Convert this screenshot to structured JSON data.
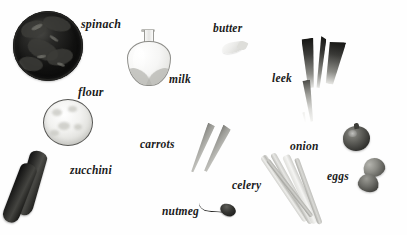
{
  "diagram": {
    "kind": "ingredient-photo-diagram",
    "background_color": "#ffffff",
    "label_color": "#1a1a1a",
    "label_style": "italic serif",
    "labels": [
      {
        "id": "spinach",
        "text": "spinach",
        "x": 81,
        "y": 18
      },
      {
        "id": "butter",
        "text": "butter",
        "x": 213,
        "y": 23
      },
      {
        "id": "milk",
        "text": "milk",
        "x": 169,
        "y": 74
      },
      {
        "id": "leek",
        "text": "leek",
        "x": 272,
        "y": 73
      },
      {
        "id": "flour",
        "text": "flour",
        "x": 78,
        "y": 86
      },
      {
        "id": "carrots",
        "text": "carrots",
        "x": 140,
        "y": 139
      },
      {
        "id": "onion",
        "text": "onion",
        "x": 290,
        "y": 141
      },
      {
        "id": "zucchini",
        "text": "zucchini",
        "x": 70,
        "y": 165
      },
      {
        "id": "eggs",
        "text": "eggs",
        "x": 327,
        "y": 171
      },
      {
        "id": "celery",
        "text": "celery",
        "x": 232,
        "y": 180
      },
      {
        "id": "nutmeg",
        "text": "nutmeg",
        "x": 162,
        "y": 206
      }
    ],
    "objects": [
      {
        "id": "spinach-bowl",
        "icon": "spinach-bowl-photo",
        "label": "spinach"
      },
      {
        "id": "flour-bowl",
        "icon": "flour-bowl-photo",
        "label": "flour"
      },
      {
        "id": "milk-jug",
        "icon": "milk-jug-photo",
        "label": "milk"
      },
      {
        "id": "butter-piece",
        "icon": "butter-piece-photo",
        "label": "butter"
      },
      {
        "id": "leek-plant",
        "icon": "leek-photo",
        "label": "leek"
      },
      {
        "id": "carrots",
        "icon": "carrots-photo",
        "label": "carrots"
      },
      {
        "id": "zucchini",
        "icon": "zucchini-photo",
        "label": "zucchini"
      },
      {
        "id": "nutmeg-piece",
        "icon": "nutmeg-photo",
        "label": "nutmeg"
      },
      {
        "id": "celery-bunch",
        "icon": "celery-photo",
        "label": "celery"
      },
      {
        "id": "onion-bulb",
        "icon": "onion-photo",
        "label": "onion"
      },
      {
        "id": "eggs",
        "icon": "eggs-photo",
        "label": "eggs"
      }
    ]
  }
}
